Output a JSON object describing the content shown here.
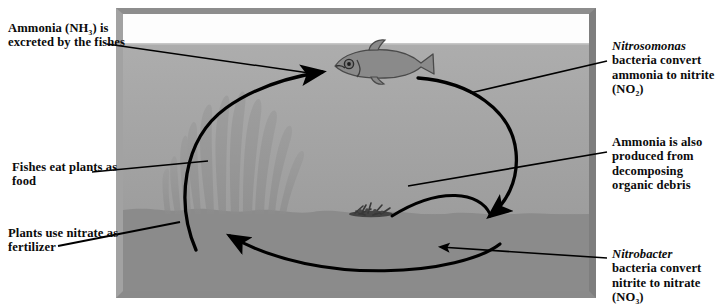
{
  "diagram": {
    "colors": {
      "text": "#0b0b0b",
      "frame": "#9a9a9a",
      "water": "#a6a6a6",
      "gravel": "#8a8a8a",
      "arrow": "#000000",
      "page_background": "#ffffff"
    }
  },
  "captions": {
    "ammonia_excreted": {
      "text": "Ammonia (NH₃) is excreted by the fishes",
      "lines": [
        "Ammonia (NH₃)",
        "is excreted by the",
        "fishes"
      ]
    },
    "fishes_eat_plants": {
      "text": "Fishes eat plants as food",
      "lines": [
        "Fishes eat plants",
        "as food"
      ]
    },
    "plants_use_nitrate": {
      "text": "Plants use nitrate as fertilizer",
      "lines": [
        "Plants use",
        "nitrate as",
        "fertilizer"
      ]
    },
    "nitrosomonas": {
      "species": "Nitrosomonas",
      "text": "bacteria convert ammonia to nitrite (NO₂)",
      "lines": [
        "bacteria convert",
        "ammonia to",
        "nitrite (NO₂)"
      ]
    },
    "ammonia_debris": {
      "text": "Ammonia is also produced from decomposing organic debris",
      "lines": [
        "Ammonia is also",
        "produced from",
        "decomposing",
        "organic debris"
      ]
    },
    "nitrobacter": {
      "species": "Nitrobacter",
      "text": "bacteria convert nitrite to nitrate (NO₃)",
      "lines": [
        "bacteria convert",
        "nitrite to nitrate",
        "(NO₃)"
      ]
    }
  },
  "scene": {
    "fish_label": "fish",
    "plants_label": "aquatic plants",
    "debris_label": "decomposing organic debris",
    "gravel_label": "gravel substrate",
    "water_label": "water",
    "tank_label": "aquarium tank"
  }
}
